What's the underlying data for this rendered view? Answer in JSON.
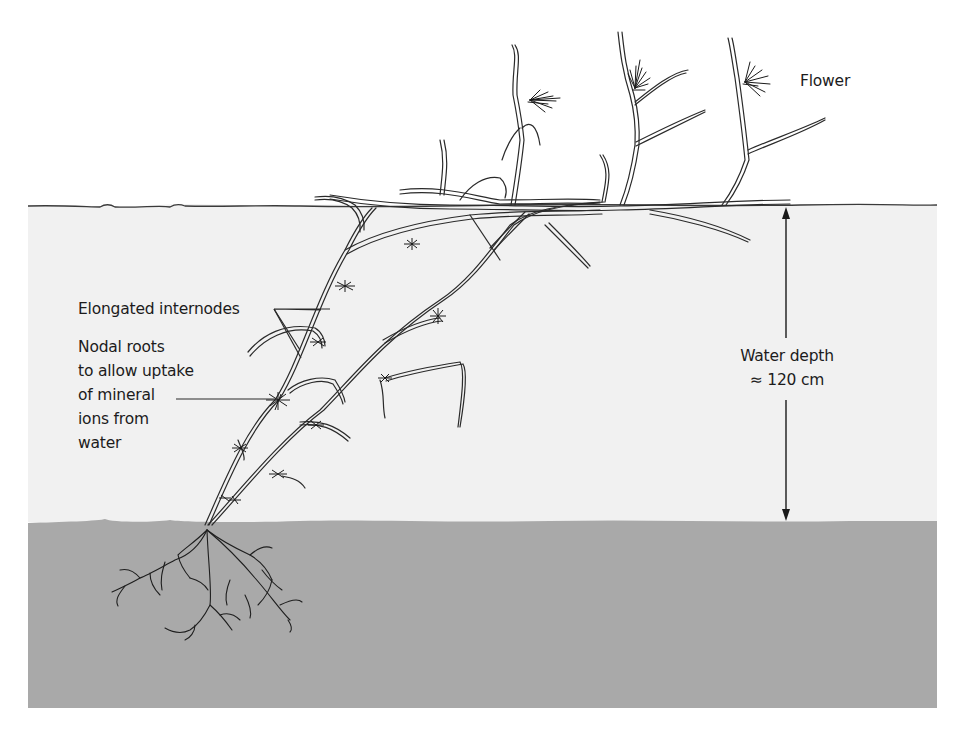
{
  "figure": {
    "colors": {
      "background": "#ffffff",
      "water": "#f1f1f1",
      "sediment": "#a9a9a9",
      "line": "#2a2a2a"
    }
  },
  "labels": {
    "flower": "Flower",
    "internodes": "Elongated internodes",
    "nodal_roots": {
      "line1": "Nodal roots",
      "line2": "to allow uptake",
      "line3": "of mineral",
      "line4": "ions from",
      "line5": "water"
    },
    "water_depth": {
      "line1": "Water depth",
      "line2": "≈ 120 cm"
    }
  },
  "regions": [
    {
      "name": "air",
      "y_range": [
        0,
        206
      ]
    },
    {
      "name": "water",
      "y_range": [
        206,
        522
      ]
    },
    {
      "name": "sediment",
      "y_range": [
        522,
        708
      ]
    }
  ]
}
